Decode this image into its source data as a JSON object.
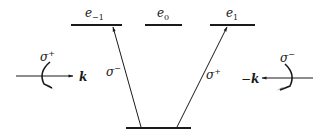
{
  "diagram": {
    "levels": [
      {
        "id": "e_minus1",
        "label": "e",
        "sub": "−1"
      },
      {
        "id": "e_0",
        "label": "e",
        "sub": "0"
      },
      {
        "id": "e_1",
        "label": "e",
        "sub": "1"
      },
      {
        "id": "ground",
        "label": ""
      }
    ],
    "transitions": [
      {
        "from": "ground",
        "to": "e_minus1",
        "label": "σ",
        "sup": "−"
      },
      {
        "from": "ground",
        "to": "e_1",
        "label": "σ",
        "sup": "+"
      }
    ],
    "beams": {
      "left": {
        "polarization": "σ",
        "pol_sup": "+",
        "wavevector": "k"
      },
      "right": {
        "polarization": "σ",
        "pol_sup": "−",
        "wavevector": "k",
        "sign": "−"
      }
    }
  }
}
